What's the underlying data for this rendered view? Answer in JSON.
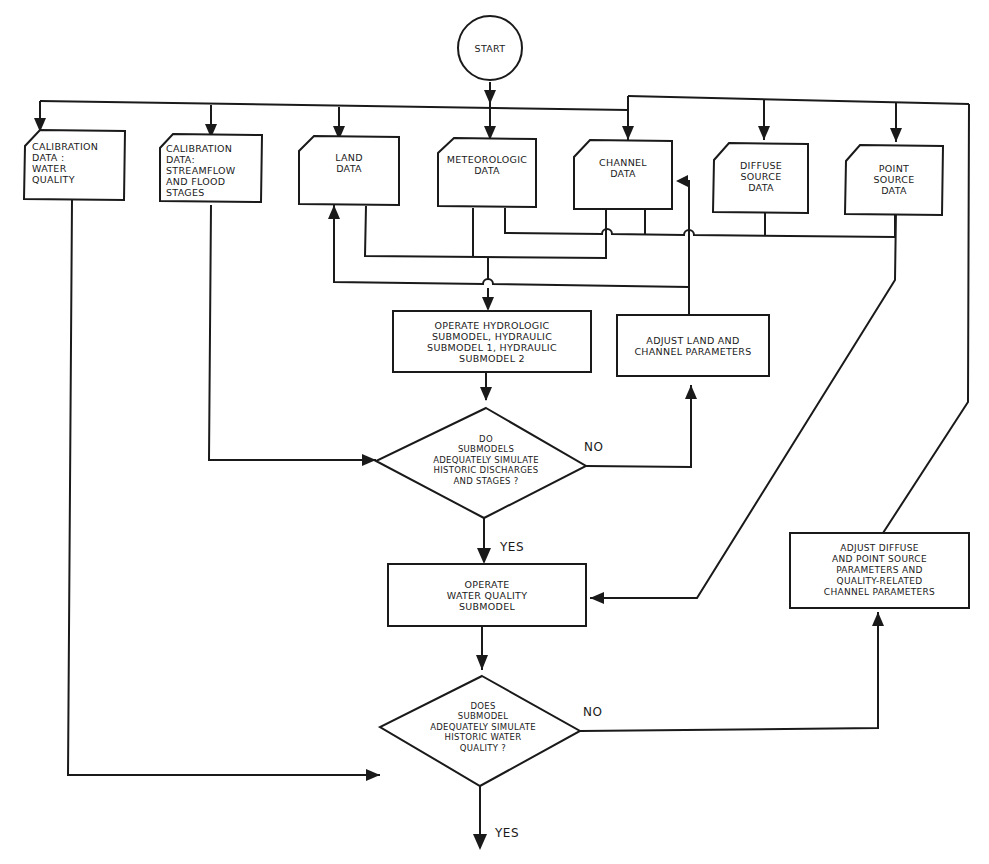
{
  "diagram": {
    "type": "flowchart",
    "colors": {
      "stroke": "#1a1a1a",
      "background": "#ffffff"
    },
    "nodes": {
      "start": {
        "shape": "circle",
        "lines": [
          "START"
        ]
      },
      "cal_wq": {
        "shape": "card",
        "lines": [
          "CALIBRATION",
          "DATA :",
          "WATER",
          "QUALITY"
        ]
      },
      "cal_sf": {
        "shape": "card",
        "lines": [
          "CALIBRATION",
          "DATA:",
          "STREAMFLOW",
          "AND FLOOD",
          "STAGES"
        ]
      },
      "land": {
        "shape": "card",
        "lines": [
          "LAND",
          "DATA"
        ]
      },
      "met": {
        "shape": "card",
        "lines": [
          "METEOROLOGIC",
          "DATA"
        ]
      },
      "channel": {
        "shape": "card",
        "lines": [
          "CHANNEL",
          "DATA"
        ]
      },
      "diffuse": {
        "shape": "card",
        "lines": [
          "DIFFUSE",
          "SOURCE",
          "DATA"
        ]
      },
      "point": {
        "shape": "card",
        "lines": [
          "POINT",
          "SOURCE",
          "DATA"
        ]
      },
      "op_hydro": {
        "shape": "process",
        "lines": [
          "OPERATE HYDROLOGIC",
          "SUBMODEL, HYDRAULIC",
          "SUBMODEL 1, HYDRAULIC",
          "SUBMODEL 2"
        ]
      },
      "adj_land": {
        "shape": "process",
        "lines": [
          "ADJUST LAND AND",
          "CHANNEL PARAMETERS"
        ]
      },
      "dec1": {
        "shape": "decision",
        "lines": [
          "DO",
          "SUBMODELS",
          "ADEQUATELY SIMULATE",
          "HISTORIC DISCHARGES",
          "AND STAGES ?"
        ]
      },
      "op_wq": {
        "shape": "process",
        "lines": [
          "OPERATE",
          "WATER QUALITY",
          "SUBMODEL"
        ]
      },
      "adj_diffuse": {
        "shape": "process",
        "lines": [
          "ADJUST DIFFUSE",
          "AND POINT SOURCE",
          "PARAMETERS AND",
          "QUALITY-RELATED",
          "CHANNEL PARAMETERS"
        ]
      },
      "dec2": {
        "shape": "decision",
        "lines": [
          "DOES",
          "SUBMODEL",
          "ADEQUATELY SIMULATE",
          "HISTORIC WATER",
          "QUALITY ?"
        ]
      }
    },
    "edge_labels": {
      "dec1_no": "NO",
      "dec1_yes": "YES",
      "dec2_no": "NO",
      "dec2_yes": "YES"
    },
    "edges": [
      [
        "start",
        "all data inputs"
      ],
      [
        "land",
        "op_hydro"
      ],
      [
        "met",
        "op_hydro"
      ],
      [
        "channel",
        "op_hydro"
      ],
      [
        "op_hydro",
        "dec1"
      ],
      [
        "cal_sf",
        "dec1"
      ],
      [
        "dec1",
        "adj_land",
        "NO"
      ],
      [
        "adj_land",
        "land"
      ],
      [
        "adj_land",
        "channel"
      ],
      [
        "dec1",
        "op_wq",
        "YES"
      ],
      [
        "diffuse",
        "op_wq"
      ],
      [
        "point",
        "op_wq"
      ],
      [
        "met",
        "op_wq"
      ],
      [
        "op_wq",
        "dec2"
      ],
      [
        "cal_wq",
        "dec2"
      ],
      [
        "dec2",
        "adj_diffuse",
        "NO"
      ],
      [
        "adj_diffuse",
        "channel/diffuse/point data"
      ],
      [
        "dec2",
        "end",
        "YES"
      ]
    ]
  }
}
